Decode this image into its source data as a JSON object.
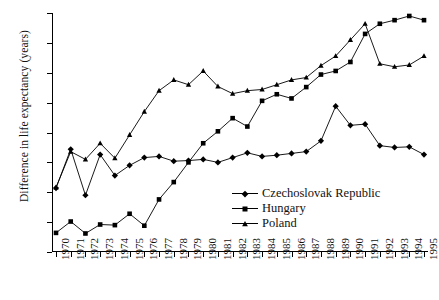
{
  "chart_data": {
    "type": "line",
    "title": "",
    "xlabel": "",
    "ylabel": "Difference in life expectancy (years)",
    "ylim": [
      5.5,
      9.5
    ],
    "yticks": [
      "5.5",
      "6",
      "6.5",
      "7",
      "7.5",
      "8",
      "8.5",
      "9",
      "9.5"
    ],
    "grid": false,
    "legend_position": "inside-lower-right",
    "categories": [
      "1970",
      "1971",
      "1972",
      "1973",
      "1974",
      "1975",
      "1976",
      "1977",
      "1978",
      "1979",
      "1980",
      "1981",
      "1982",
      "1983",
      "1984",
      "1985",
      "1986",
      "1987",
      "1988",
      "1989",
      "1990",
      "1991",
      "1992",
      "1993",
      "1994",
      "1995"
    ],
    "series": [
      {
        "name": "Czechoslovak Republic",
        "marker": "diamond",
        "values": [
          6.57,
          7.22,
          6.45,
          7.13,
          6.78,
          6.95,
          7.08,
          7.1,
          7.02,
          7.03,
          7.05,
          7.0,
          7.08,
          7.16,
          7.1,
          7.12,
          7.15,
          7.18,
          7.36,
          7.94,
          7.62,
          7.64,
          7.28,
          7.25,
          7.26,
          7.13
        ]
      },
      {
        "name": "Hungary",
        "marker": "square",
        "values": [
          5.82,
          6.01,
          5.81,
          5.96,
          5.95,
          6.14,
          5.94,
          6.38,
          6.67,
          7.0,
          7.32,
          7.52,
          7.74,
          7.6,
          8.03,
          8.14,
          8.07,
          8.26,
          8.47,
          8.53,
          8.68,
          9.15,
          9.32,
          9.38,
          9.45,
          9.38
        ]
      },
      {
        "name": "Poland",
        "marker": "triangle",
        "values": [
          6.58,
          7.18,
          7.05,
          7.32,
          7.07,
          7.46,
          7.85,
          8.2,
          8.38,
          8.3,
          8.53,
          8.27,
          8.15,
          8.2,
          8.22,
          8.3,
          8.38,
          8.42,
          8.62,
          8.78,
          9.05,
          9.32,
          8.65,
          8.6,
          8.63,
          8.78
        ]
      }
    ]
  },
  "legend": {
    "items": [
      {
        "label": "Czechoslovak Republic"
      },
      {
        "label": "Hungary"
      },
      {
        "label": "Poland"
      }
    ]
  }
}
